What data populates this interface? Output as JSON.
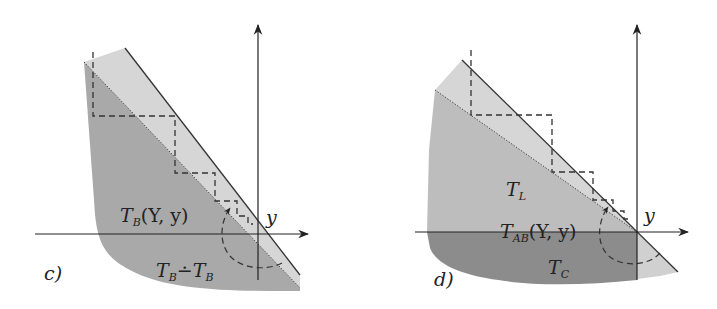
{
  "figure": {
    "panels": [
      {
        "id": "c",
        "panel_label": "c)",
        "axis_label_y": "y",
        "region_labels": {
          "upper": {
            "base": "T",
            "sub": "B",
            "args": "(Y, y)"
          },
          "lower": {
            "left_base": "T",
            "left_sub": "B",
            "op": "∸",
            "right_base": "T",
            "right_sub": "B"
          }
        },
        "colors": {
          "light_region": "#d6d6d6",
          "dark_region": "#a9a9a9",
          "lines": "#333333"
        }
      },
      {
        "id": "d",
        "panel_label": "d)",
        "axis_label_y": "y",
        "region_labels": {
          "upper": {
            "base": "T",
            "sub": "L"
          },
          "middle": {
            "base": "T",
            "sub": "AB",
            "args": "(Y, y)"
          },
          "lower": {
            "base": "T",
            "sub": "C"
          }
        },
        "colors": {
          "light_region": "#d6d6d6",
          "mid_region": "#bdbdbd",
          "dark_region": "#8c8c8c",
          "lines": "#333333"
        }
      }
    ]
  }
}
